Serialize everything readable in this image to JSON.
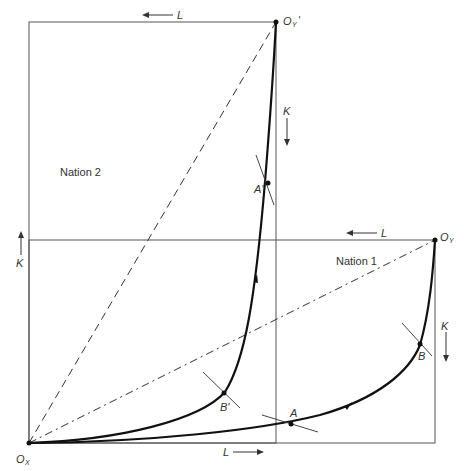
{
  "diagram": {
    "type": "edgeworth-box-contract-curves",
    "nations": [
      {
        "label": "Nation 1",
        "origin_x": "O",
        "origin_x_sub": "X",
        "origin_y": "O",
        "origin_y_sub": "Y"
      },
      {
        "label": "Nation 2",
        "origin_y": "O",
        "origin_y_sub": "Y",
        "origin_y_prime": "'"
      }
    ],
    "axis_labels": {
      "top_l": "L",
      "mid_l": "L",
      "bottom_l": "L",
      "left_k": "K",
      "right_k_nation1": "K",
      "right_k_nation2": "K"
    },
    "points": {
      "A": "A",
      "B": "B",
      "A_prime": "A'",
      "B_prime": "B'"
    },
    "colors": {
      "line": "#555555",
      "curve": "#111111",
      "text": "#333333"
    }
  }
}
